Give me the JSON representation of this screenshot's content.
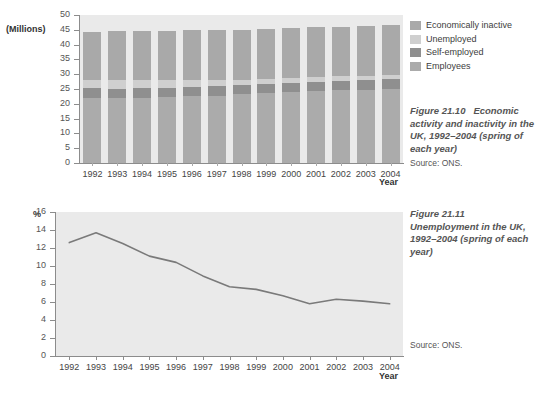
{
  "figure1": {
    "unit_label": "(Millions)",
    "xaxis_title": "Year",
    "caption_title": "Figure 21.10",
    "caption_text": "Economic activity and inactivity in the UK, 1992–2004 (spring of each year)",
    "caption_source": "Source: ONS.",
    "legend": [
      {
        "label": "Economically inactive",
        "color": "#a9a9a9"
      },
      {
        "label": "Unemployed",
        "color": "#cfcfcf"
      },
      {
        "label": "Self-employed",
        "color": "#8f8f8f"
      },
      {
        "label": "Employees",
        "color": "#ababab"
      }
    ]
  },
  "figure2": {
    "unit_label": "%",
    "xaxis_title": "Year",
    "caption_title": "Figure 21.11",
    "caption_text": "Unemployment in the UK, 1992–2004 (spring of each year)",
    "caption_source": "Source: ONS.",
    "line_color": "#7a7a7a"
  },
  "chart_data": [
    {
      "type": "bar",
      "title": "Figure 21.10 Economic activity and inactivity in the UK, 1992–2004 (spring of each year)",
      "subtitle": "Source: ONS.",
      "stacked": true,
      "xlabel": "Year",
      "ylabel": "(Millions)",
      "ylim": [
        0,
        50
      ],
      "yticks": [
        0,
        5,
        10,
        15,
        20,
        25,
        30,
        35,
        40,
        45,
        50
      ],
      "grid": false,
      "legend_position": "right",
      "categories": [
        "1992",
        "1993",
        "1994",
        "1995",
        "1996",
        "1997",
        "1998",
        "1999",
        "2000",
        "2001",
        "2002",
        "2003",
        "2004"
      ],
      "series": [
        {
          "name": "Employees",
          "color": "#ababab",
          "values": [
            22.1,
            21.8,
            22.1,
            22.3,
            22.6,
            22.8,
            23.3,
            23.6,
            24.0,
            24.4,
            24.6,
            24.8,
            25.0
          ]
        },
        {
          "name": "Self-employed",
          "color": "#8f8f8f",
          "values": [
            3.2,
            3.2,
            3.1,
            3.1,
            3.2,
            3.2,
            3.1,
            3.1,
            3.0,
            3.1,
            3.2,
            3.3,
            3.4
          ]
        },
        {
          "name": "Unemployed",
          "color": "#cfcfcf",
          "values": [
            2.6,
            2.9,
            2.7,
            2.5,
            2.3,
            2.0,
            1.8,
            1.7,
            1.6,
            1.5,
            1.5,
            1.4,
            1.4
          ]
        },
        {
          "name": "Economically inactive",
          "color": "#a9a9a9",
          "values": [
            16.3,
            16.6,
            16.7,
            16.7,
            16.7,
            17.0,
            16.8,
            17.0,
            16.9,
            16.8,
            16.7,
            16.7,
            16.7
          ]
        }
      ],
      "totals": [
        44.2,
        44.5,
        44.6,
        44.6,
        44.8,
        45.0,
        45.0,
        45.4,
        45.5,
        45.8,
        46.0,
        46.2,
        46.5
      ]
    },
    {
      "type": "line",
      "title": "Figure 21.11 Unemployment in the UK, 1992–2004 (spring of each year)",
      "subtitle": "Source: ONS.",
      "xlabel": "Year",
      "ylabel": "%",
      "ylim": [
        0,
        16
      ],
      "yticks": [
        0,
        2,
        4,
        6,
        8,
        10,
        12,
        14,
        16
      ],
      "grid": false,
      "legend_position": "none",
      "x": [
        "1992",
        "1993",
        "1994",
        "1995",
        "1996",
        "1997",
        "1998",
        "1999",
        "2000",
        "2001",
        "2002",
        "2003",
        "2004"
      ],
      "series": [
        {
          "name": "Unemployment rate",
          "color": "#7a7a7a",
          "values": [
            12.6,
            13.7,
            12.5,
            11.1,
            10.4,
            8.9,
            7.7,
            7.4,
            6.7,
            5.8,
            6.3,
            6.1,
            5.8
          ]
        }
      ]
    }
  ]
}
